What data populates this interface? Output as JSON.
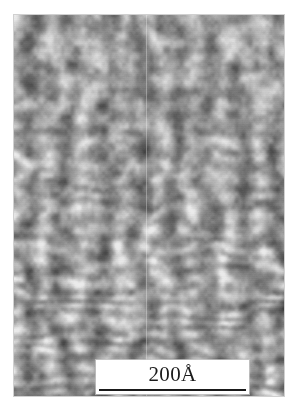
{
  "figure": {
    "kind": "scanning-tunneling-microscopy-image",
    "background_color": "#ffffff"
  },
  "micrograph": {
    "alt_text": "Grayscale scanning probe micrograph showing wavy vertical stripe corrugations with dark nodular contrast",
    "frame": {
      "x": 14,
      "y": 15,
      "width": 270,
      "height": 381
    },
    "base_gray": "#9a9a9a",
    "dark_gray": "#2e2e2e",
    "light_gray": "#d6d6d6",
    "seam_x": 146
  },
  "scale_bar": {
    "value": "200",
    "unit": "Å",
    "label": "200Å",
    "box": {
      "x": 96,
      "y": 360,
      "width": 153,
      "height": 34
    },
    "rule_color": "#1a1a1a",
    "box_color": "#ffffff"
  },
  "chart_data": {
    "type": "heatmap",
    "title": "",
    "xlabel": "",
    "ylabel": "",
    "colormap": "grayscale",
    "value_range": [
      0,
      255
    ],
    "grid": false,
    "legend": "none",
    "annotations": [
      {
        "text": "200Å",
        "role": "scale-bar",
        "x": 172,
        "y": 377
      }
    ]
  }
}
